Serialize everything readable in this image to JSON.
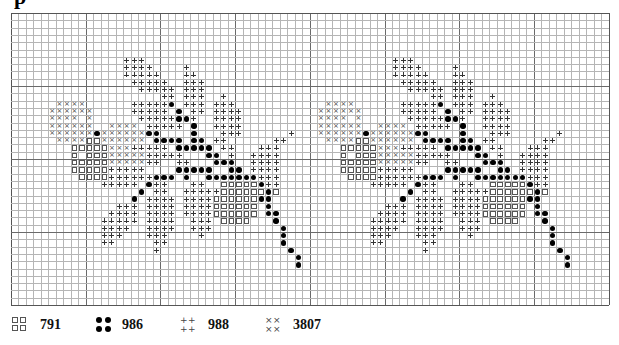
{
  "header": {
    "title_fragment": "p"
  },
  "grid": {
    "cols": 80,
    "rows": 40,
    "cell_w": 7.47,
    "cell_h": 7.3,
    "major_every": 10,
    "motif_offsets": [
      0,
      36
    ],
    "motif_start_row": 6,
    "motif_rows": [
      "...............+++......................",
      "...............++++....+................",
      "...............+++++...++...............",
      "................+++++..+++..............",
      ".................+++++.+++..............",
      "....................++.+++..+...........",
      "......xxxx......+++++o.+++.+++..........",
      ".....xxxxxx.....+++++.o.++.++++.........",
      ".....xxxx.x......+++++oo+..++++.........",
      ".....xxxxxx..xxxx.+++++.o..++++.........",
      ".....xxxxxxoxxxxxxoo....o...+++......+..",
      "......xxxxssxxxxxx.oooo.oo.++......++...",
      "........sssssxxx+++++.ooooo.++...+++....",
      "........s.sssxxxxx+++++...oo.+..++++....",
      "........sssssxxxxx++..++...ooo..++++....",
      "........sssss+++++....ooooo..oo.++++....",
      ".........ssss++++++ooo o..ooooooo+++....",
      "............+++++.o++...++..ssssso++....",
      ".................o.++..+++++ssssssos....",
      "................o.++++.++++ssssssoo.....",
      "..............+++.++++.++++ssssss.o.....",
      ".............++++.++++.++++ssssss.oo....",
      "............+++++.++++..+++.ssss...o....",
      "............++++..++++..+++.........o...",
      "............+++...+++....+..........o...",
      "............++.....++...............o...",
      "...................+.................o..",
      "......................................o.",
      "......................................o."
    ]
  },
  "legend": [
    {
      "symbol": "square",
      "code": "791"
    },
    {
      "symbol": "dot",
      "code": "986"
    },
    {
      "symbol": "plus",
      "code": "988"
    },
    {
      "symbol": "cross",
      "code": "3807"
    }
  ]
}
